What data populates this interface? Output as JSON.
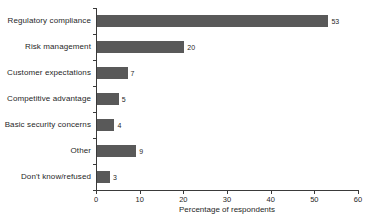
{
  "chart_data": {
    "type": "bar",
    "orientation": "horizontal",
    "title": "",
    "subtitle": "",
    "xlabel": "Percentage of respondents",
    "ylabel": "",
    "xlim": [
      0,
      60
    ],
    "xticks": [
      0,
      10,
      20,
      30,
      40,
      50,
      60
    ],
    "xtick_labels": [
      "0",
      "10",
      "20",
      "30",
      "40",
      "50",
      "60"
    ],
    "grid": false,
    "legend": null,
    "bar_color": "#595959",
    "axis_color": "#3a3a3a",
    "background": "#ffffff",
    "categories": [
      "Regulatory compliance",
      "Risk management",
      "Customer expectations",
      "Competitive advantage",
      "Basic security concerns",
      "Other",
      "Don't know/refused"
    ],
    "values": [
      53,
      20,
      7,
      5,
      4,
      9,
      3
    ],
    "value_labels": [
      "53",
      "20",
      "7",
      "5",
      "4",
      "9",
      "3"
    ],
    "bars": [
      {
        "label": "Regulatory compliance",
        "value": 53,
        "value_label": "53"
      },
      {
        "label": "Risk management",
        "value": 20,
        "value_label": "20"
      },
      {
        "label": "Customer expectations",
        "value": 7,
        "value_label": "7"
      },
      {
        "label": "Competitive advantage",
        "value": 5,
        "value_label": "5"
      },
      {
        "label": "Basic security concerns",
        "value": 4,
        "value_label": "4"
      },
      {
        "label": "Other",
        "value": 9,
        "value_label": "9"
      },
      {
        "label": "Don't know/refused",
        "value": 3,
        "value_label": "3"
      }
    ]
  }
}
